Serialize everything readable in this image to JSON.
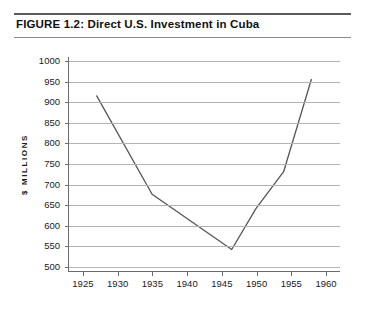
{
  "figure": {
    "title": "FIGURE 1.2: Direct U.S. Investment in Cuba"
  },
  "chart_data": {
    "type": "line",
    "title": "FIGURE 1.2: Direct U.S. Investment in Cuba",
    "xlabel": "",
    "ylabel": "$ MILLIONS",
    "xlim": [
      1923,
      1962
    ],
    "ylim": [
      490,
      1010
    ],
    "xticks": [
      1925,
      1930,
      1935,
      1940,
      1945,
      1950,
      1955,
      1960
    ],
    "yticks": [
      500,
      550,
      600,
      650,
      700,
      750,
      800,
      850,
      900,
      950,
      1000
    ],
    "grid": "horizontal",
    "legend": "none",
    "line_color": "#555555",
    "series": [
      {
        "name": "Direct U.S. Investment in Cuba",
        "x": [
          1927,
          1935,
          1946.5,
          1950,
          1954,
          1958
        ],
        "values": [
          915,
          675,
          540,
          640,
          730,
          955
        ]
      }
    ]
  }
}
